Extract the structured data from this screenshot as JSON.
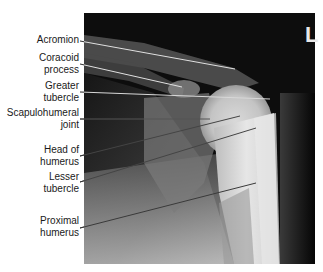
{
  "figure": {
    "type": "Radiograph (X-ray) of left shoulder, AP view",
    "side_marker": "L",
    "caption_visible": false
  },
  "labels": [
    {
      "id": "acromion",
      "lines": [
        "Acromion"
      ]
    },
    {
      "id": "coracoid-process",
      "lines": [
        "Coracoid",
        "process"
      ]
    },
    {
      "id": "greater-tubercle",
      "lines": [
        "Greater",
        "tubercle"
      ]
    },
    {
      "id": "scapulohumeral-joint",
      "lines": [
        "Scapulohumeral",
        "joint"
      ]
    },
    {
      "id": "head-of-humerus",
      "lines": [
        "Head of",
        "humerus"
      ]
    },
    {
      "id": "lesser-tubercle",
      "lines": [
        "Lesser",
        "tubercle"
      ]
    },
    {
      "id": "proximal-humerus",
      "lines": [
        "Proximal",
        "humerus"
      ]
    }
  ],
  "leader_lines": [
    {
      "label": "acromion",
      "from": [
        80,
        41
      ],
      "to": [
        235,
        69
      ],
      "color": "#e0e0e0"
    },
    {
      "label": "coracoid-process",
      "from": [
        80,
        64
      ],
      "to": [
        182,
        87
      ],
      "color": "#e0e0e0"
    },
    {
      "label": "greater-tubercle",
      "from": [
        80,
        92
      ],
      "to": [
        270,
        99
      ],
      "color": "#d8d8d8"
    },
    {
      "label": "scapulohumeral-joint",
      "from": [
        80,
        119
      ],
      "to": [
        210,
        119
      ],
      "color": "#555555"
    },
    {
      "label": "head-of-humerus",
      "from": [
        80,
        156
      ],
      "to": [
        240,
        116
      ],
      "color": "#444444"
    },
    {
      "label": "lesser-tubercle",
      "from": [
        80,
        182
      ],
      "to": [
        256,
        128
      ],
      "color": "#444444"
    },
    {
      "label": "proximal-humerus",
      "from": [
        80,
        228
      ],
      "to": [
        256,
        183
      ],
      "color": "#3a3a3a"
    }
  ]
}
